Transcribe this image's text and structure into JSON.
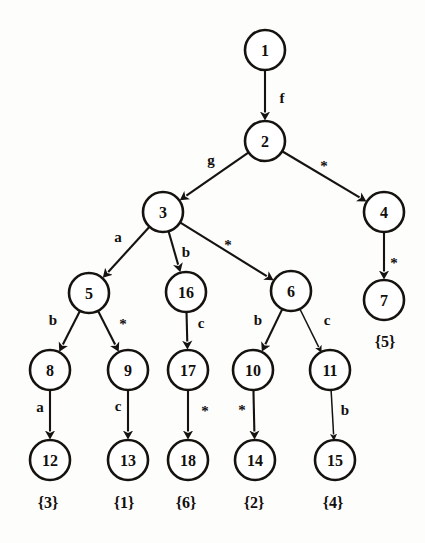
{
  "figure": {
    "kind": "directed-tree",
    "background_color": "#fdfdfc",
    "ink_color": "#15120f",
    "node_fill": "#ffffff",
    "node_radius": 20
  },
  "nodes": [
    {
      "id": "n1",
      "label": "1",
      "cx": 265,
      "cy": 50,
      "r": 20
    },
    {
      "id": "n2",
      "label": "2",
      "cx": 265,
      "cy": 141,
      "r": 20
    },
    {
      "id": "n3",
      "label": "3",
      "cx": 163,
      "cy": 212,
      "r": 20
    },
    {
      "id": "n4",
      "label": "4",
      "cx": 384,
      "cy": 212,
      "r": 20
    },
    {
      "id": "n5",
      "label": "5",
      "cx": 89,
      "cy": 293,
      "r": 20
    },
    {
      "id": "n16",
      "label": "16",
      "cx": 186,
      "cy": 292,
      "r": 20
    },
    {
      "id": "n6",
      "label": "6",
      "cx": 291,
      "cy": 291,
      "r": 20
    },
    {
      "id": "n7",
      "label": "7",
      "cx": 384,
      "cy": 300,
      "r": 20
    },
    {
      "id": "n8",
      "label": "8",
      "cx": 50,
      "cy": 370,
      "r": 20
    },
    {
      "id": "n9",
      "label": "9",
      "cx": 128,
      "cy": 370,
      "r": 20
    },
    {
      "id": "n17",
      "label": "17",
      "cx": 188,
      "cy": 370,
      "r": 20
    },
    {
      "id": "n10",
      "label": "10",
      "cx": 253,
      "cy": 370,
      "r": 20
    },
    {
      "id": "n11",
      "label": "11",
      "cx": 330,
      "cy": 370,
      "r": 20
    },
    {
      "id": "n12",
      "label": "12",
      "cx": 50,
      "cy": 460,
      "r": 20
    },
    {
      "id": "n13",
      "label": "13",
      "cx": 128,
      "cy": 460,
      "r": 20
    },
    {
      "id": "n18",
      "label": "18",
      "cx": 188,
      "cy": 460,
      "r": 20
    },
    {
      "id": "n14",
      "label": "14",
      "cx": 255,
      "cy": 460,
      "r": 20
    },
    {
      "id": "n15",
      "label": "15",
      "cx": 335,
      "cy": 460,
      "r": 20
    }
  ],
  "edges": [
    {
      "id": "e1",
      "from": "n1",
      "to": "n2",
      "label": "f",
      "lx": 282,
      "ly": 98,
      "weight": "bold"
    },
    {
      "id": "e2",
      "from": "n2",
      "to": "n3",
      "label": "g",
      "lx": 211,
      "ly": 160,
      "weight": "bold"
    },
    {
      "id": "e3",
      "from": "n2",
      "to": "n4",
      "label": "*",
      "lx": 324,
      "ly": 162,
      "weight": "bold"
    },
    {
      "id": "e4",
      "from": "n3",
      "to": "n5",
      "label": "a",
      "lx": 118,
      "ly": 237,
      "weight": "bold"
    },
    {
      "id": "e5",
      "from": "n3",
      "to": "n16",
      "label": "b",
      "lx": 186,
      "ly": 252,
      "weight": "bold"
    },
    {
      "id": "e6",
      "from": "n3",
      "to": "n6",
      "label": "*",
      "lx": 228,
      "ly": 241,
      "weight": "bold"
    },
    {
      "id": "e7",
      "from": "n4",
      "to": "n7",
      "label": "*",
      "lx": 394,
      "ly": 259,
      "weight": "bold"
    },
    {
      "id": "e8",
      "from": "n5",
      "to": "n8",
      "label": "b",
      "lx": 53,
      "ly": 320,
      "weight": "bold"
    },
    {
      "id": "e9",
      "from": "n5",
      "to": "n9",
      "label": "*",
      "lx": 123,
      "ly": 320,
      "weight": "bold"
    },
    {
      "id": "e10",
      "from": "n16",
      "to": "n17",
      "label": "c",
      "lx": 201,
      "ly": 323,
      "weight": "bold"
    },
    {
      "id": "e11",
      "from": "n6",
      "to": "n10",
      "label": "b",
      "lx": 258,
      "ly": 320,
      "weight": "bold"
    },
    {
      "id": "e12",
      "from": "n6",
      "to": "n11",
      "label": "c",
      "lx": 327,
      "ly": 320,
      "weight": "thin"
    },
    {
      "id": "e13",
      "from": "n8",
      "to": "n12",
      "label": "a",
      "lx": 40,
      "ly": 407,
      "weight": "bold"
    },
    {
      "id": "e14",
      "from": "n9",
      "to": "n13",
      "label": "c",
      "lx": 118,
      "ly": 406,
      "weight": "bold"
    },
    {
      "id": "e15",
      "from": "n17",
      "to": "n18",
      "label": "*",
      "lx": 205,
      "ly": 407,
      "weight": "bold"
    },
    {
      "id": "e16",
      "from": "n10",
      "to": "n14",
      "label": "*",
      "lx": 242,
      "ly": 406,
      "weight": "bold"
    },
    {
      "id": "e17",
      "from": "n11",
      "to": "n15",
      "label": "b",
      "lx": 345,
      "ly": 410,
      "weight": "thin"
    }
  ],
  "accept_labels": [
    {
      "id": "a5",
      "text": "{5}",
      "x": 385,
      "y": 341,
      "for": "n7"
    },
    {
      "id": "a3",
      "text": "{3}",
      "x": 48,
      "y": 502,
      "for": "n12"
    },
    {
      "id": "a1",
      "text": "{1}",
      "x": 124,
      "y": 502,
      "for": "n13"
    },
    {
      "id": "a6",
      "text": "{6}",
      "x": 186,
      "y": 502,
      "for": "n18"
    },
    {
      "id": "a2",
      "text": "{2}",
      "x": 254,
      "y": 502,
      "for": "n14"
    },
    {
      "id": "a4",
      "text": "{4}",
      "x": 333,
      "y": 502,
      "for": "n15"
    }
  ]
}
